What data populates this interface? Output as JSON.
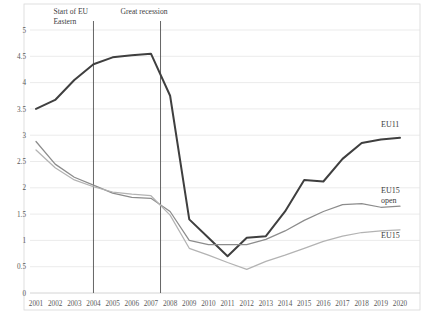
{
  "chart_data": {
    "type": "line",
    "title": "",
    "xlabel": "",
    "ylabel": "",
    "grid": true,
    "legend_position": "right-inline",
    "ylim": [
      0,
      5
    ],
    "yticks": [
      "0",
      "0.5",
      "1",
      "1.5",
      "2",
      "2.5",
      "3",
      "3.5",
      "4",
      "4.5",
      "5"
    ],
    "ytick_values": [
      0,
      0.5,
      1,
      1.5,
      2,
      2.5,
      3,
      3.5,
      4,
      4.5,
      5
    ],
    "categories": [
      "2001",
      "2002",
      "2003",
      "2004",
      "2005",
      "2006",
      "2007",
      "2008",
      "2009",
      "2010",
      "2011",
      "2012",
      "2013",
      "2014",
      "2015",
      "2016",
      "2017",
      "2018",
      "2019",
      "2020"
    ],
    "x": [
      2001,
      2002,
      2003,
      2004,
      2005,
      2006,
      2007,
      2008,
      2009,
      2010,
      2011,
      2012,
      2013,
      2014,
      2015,
      2016,
      2017,
      2018,
      2019,
      2020
    ],
    "series": [
      {
        "name": "EU11",
        "color": "#3f3f3f",
        "values": [
          3.5,
          3.67,
          4.05,
          4.35,
          4.48,
          4.52,
          4.55,
          3.75,
          1.4,
          1.05,
          0.7,
          1.05,
          1.08,
          1.55,
          2.15,
          2.12,
          2.55,
          2.85,
          2.92,
          2.95
        ]
      },
      {
        "name": "EU15 open",
        "color": "#8c8c8c",
        "values": [
          2.88,
          2.45,
          2.2,
          2.05,
          1.9,
          1.82,
          1.8,
          1.55,
          1.0,
          0.92,
          0.92,
          0.92,
          1.02,
          1.18,
          1.38,
          1.55,
          1.68,
          1.7,
          1.63,
          1.65
        ]
      },
      {
        "name": "EU15",
        "color": "#b3b3b3",
        "values": [
          2.72,
          2.38,
          2.15,
          2.02,
          1.92,
          1.88,
          1.85,
          1.48,
          0.85,
          0.72,
          0.58,
          0.45,
          0.6,
          0.72,
          0.85,
          0.98,
          1.08,
          1.15,
          1.18,
          1.2
        ]
      }
    ],
    "annotations": [
      {
        "id": "eu-eastern",
        "text_line1": "Start of EU",
        "text_line2": "Eastern",
        "at_x": 2004
      },
      {
        "id": "great-recession",
        "text_line1": "Great recession",
        "text_line2": "",
        "at_x": 2007.5
      }
    ],
    "series_labels": [
      {
        "name": "EU11",
        "line2": ""
      },
      {
        "name": "EU15",
        "line2": "open"
      },
      {
        "name": "EU15",
        "line2": ""
      }
    ]
  }
}
